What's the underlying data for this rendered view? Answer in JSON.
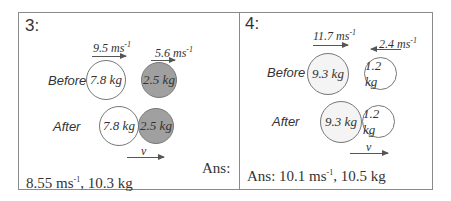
{
  "problems": [
    {
      "number": "3:",
      "before_label": "Before",
      "after_label": "After",
      "velocity_1": {
        "value": "9.5 ms",
        "exp": "-1",
        "direction": "right"
      },
      "velocity_2": {
        "value": "5.6 ms",
        "exp": "-1",
        "direction": "right"
      },
      "mass_1": "7.8 kg",
      "mass_2": "2.5 kg",
      "mass_1_fill": "#ffffff",
      "mass_2_fill": "#a0a0a0",
      "final_velocity_label": "v",
      "ans_label": "Ans:",
      "answer_part1": "8.55 ms",
      "answer_exp": "-1",
      "answer_part2": ", 10.3 kg"
    },
    {
      "number": "4:",
      "before_label": "Before",
      "after_label": "After",
      "velocity_1": {
        "value": "11.7 ms",
        "exp": "-1",
        "direction": "right"
      },
      "velocity_2": {
        "value": "2.4 ms",
        "exp": "-1",
        "direction": "left"
      },
      "mass_1": "9.3 kg",
      "mass_2": "1.2 kg",
      "mass_1_fill": "#f4f4f4",
      "mass_2_fill": "#ffffff",
      "final_velocity_label": "v",
      "ans_label": "Ans:",
      "answer_part1": "10.1 ms",
      "answer_exp": "-1",
      "answer_part2": ", 10.5 kg"
    }
  ]
}
